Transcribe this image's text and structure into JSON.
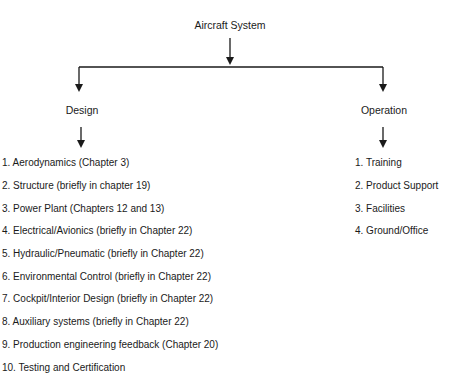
{
  "root": {
    "label": "Aircraft System"
  },
  "branches": [
    {
      "label": "Design",
      "items": [
        "1. Aerodynamics (Chapter 3)",
        "2. Structure (briefly in chapter 19)",
        "3. Power Plant (Chapters 12 and 13)",
        "4. Electrical/Avionics (briefly in Chapter 22)",
        "5. Hydraulic/Pneumatic (briefly in Chapter  22)",
        "6. Environmental Control (briefly in Chapter 22)",
        "7. Cockpit/Interior Design (briefly in Chapter 22)",
        "8. Auxiliary systems (briefly in Chapter 22)",
        "9. Production engineering feedback (Chapter 20)",
        "10. Testing and Certification"
      ]
    },
    {
      "label": "Operation",
      "items": [
        "1. Training",
        "2. Product Support",
        "3. Facilities",
        "4. Ground/Office"
      ]
    }
  ],
  "colors": {
    "line": "#1a1a1a",
    "text": "#1a1a1a",
    "background": "#ffffff"
  }
}
